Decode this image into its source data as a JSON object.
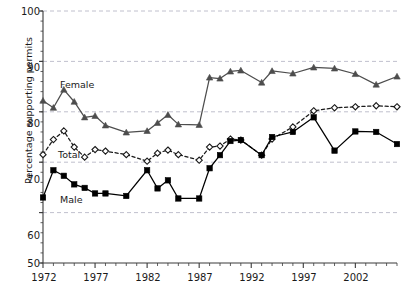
{
  "chart_data": {
    "type": "line",
    "title": "",
    "xlabel": "",
    "ylabel": "Percentage supporting permits",
    "xlim": [
      1972,
      2006
    ],
    "ylim": [
      50,
      100
    ],
    "grid": true,
    "grid_axis": "y",
    "legend_position": "inline-annotations",
    "x_tick_labels": [
      "1972",
      "1977",
      "1982",
      "1987",
      "1992",
      "1997",
      "2002"
    ],
    "x_tick_values": [
      1972,
      1977,
      1982,
      1987,
      1992,
      1997,
      2002
    ],
    "x_minor_ticks_every": 1,
    "y_tick_labels": [
      "50",
      "60",
      "70",
      "80",
      "90",
      "100"
    ],
    "y_tick_values": [
      50,
      60,
      70,
      80,
      90,
      100
    ],
    "x": [
      1972,
      1973,
      1974,
      1975,
      1976,
      1977,
      1978,
      1980,
      1982,
      1983,
      1984,
      1985,
      1987,
      1988,
      1989,
      1990,
      1991,
      1993,
      1994,
      1996,
      1998,
      2000,
      2002,
      2004,
      2006
    ],
    "series": [
      {
        "name": "Female",
        "marker": "triangle",
        "line_style": "solid",
        "color": "#4d4d4d",
        "values": [
          82.2,
          80.8,
          84.4,
          82.0,
          78.9,
          79.2,
          77.3,
          75.9,
          76.2,
          77.8,
          79.4,
          77.5,
          77.4,
          86.8,
          86.6,
          88.0,
          88.2,
          85.8,
          88.1,
          87.6,
          88.8,
          88.6,
          87.5,
          85.4,
          87.0
        ]
      },
      {
        "name": "Total",
        "marker": "diamond-open",
        "line_style": "dashed",
        "color": "#1a1a1a",
        "values": [
          71.5,
          74.5,
          76.2,
          73.0,
          71.0,
          72.5,
          72.2,
          71.5,
          70.2,
          71.8,
          72.4,
          71.5,
          70.4,
          73.0,
          73.2,
          74.6,
          74.4,
          71.4,
          74.6,
          77.0,
          80.2,
          80.8,
          81.0,
          81.2,
          81.0
        ]
      },
      {
        "name": "Male",
        "marker": "square-filled",
        "line_style": "solid",
        "color": "#000000",
        "values": [
          63.0,
          68.4,
          67.3,
          65.6,
          64.9,
          63.8,
          63.8,
          63.3,
          68.4,
          64.8,
          66.4,
          62.8,
          62.8,
          68.8,
          71.4,
          74.2,
          74.4,
          71.4,
          75.0,
          76.0,
          78.9,
          72.3,
          76.1,
          76.0,
          73.6
        ]
      }
    ]
  },
  "annotations": {
    "female_label": "Female",
    "total_label": "Total",
    "male_label": "Male"
  },
  "axis": {
    "y_title": "Percentage supporting permits"
  },
  "colors": {
    "grid": "#b9b9c7",
    "axis": "#3a3a3a",
    "female": "#4d4d4d",
    "total": "#1a1a1a",
    "male": "#000000"
  }
}
